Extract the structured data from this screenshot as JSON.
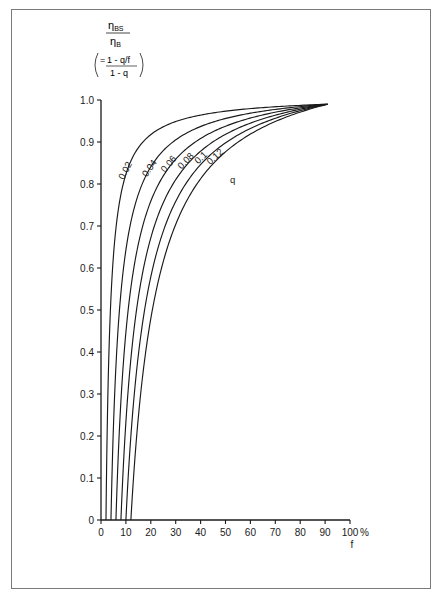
{
  "chart_data": {
    "type": "line",
    "title": "",
    "ylabel": {
      "numerator": "η_BS",
      "denominator": "η_B",
      "formula_numerator": "1 - q/f",
      "formula_denominator": "1 - q",
      "prefix": "="
    },
    "xlabel": "f",
    "x_unit": "%",
    "xlim": [
      0,
      100
    ],
    "ylim": [
      0,
      1.0
    ],
    "x_ticks": [
      0,
      10,
      20,
      30,
      40,
      50,
      60,
      70,
      80,
      90,
      100
    ],
    "x_tick_labels": [
      "0",
      "10",
      "20",
      "30",
      "40",
      "50",
      "60",
      "70",
      "80",
      "90",
      "100"
    ],
    "y_ticks": [
      0,
      0.1,
      0.2,
      0.3,
      0.4,
      0.5,
      0.6,
      0.7,
      0.8,
      0.9,
      1.0
    ],
    "y_tick_labels": [
      "0",
      "0.1",
      "0.2",
      "0.3",
      "0.4",
      "0.5",
      "0.6",
      "0.7",
      "0.8",
      "0.9",
      "1.0"
    ],
    "grid": false,
    "legend_title": "q",
    "series": [
      {
        "name": "0.02",
        "q": 0.02,
        "x": [
          2,
          5,
          10,
          20,
          30,
          50,
          70,
          91
        ],
        "values": [
          0,
          0.62,
          0.82,
          0.91,
          0.95,
          0.97,
          0.98,
          0.99
        ]
      },
      {
        "name": "0.04",
        "q": 0.04,
        "x": [
          4,
          7,
          10,
          20,
          30,
          50,
          70,
          91
        ],
        "values": [
          0,
          0.45,
          0.63,
          0.82,
          0.89,
          0.94,
          0.97,
          0.99
        ]
      },
      {
        "name": "0.06",
        "q": 0.06,
        "x": [
          6,
          10,
          15,
          20,
          30,
          50,
          70,
          91
        ],
        "values": [
          0,
          0.43,
          0.63,
          0.74,
          0.85,
          0.92,
          0.96,
          0.99
        ]
      },
      {
        "name": "0.08",
        "q": 0.08,
        "x": [
          8,
          12,
          16,
          20,
          30,
          50,
          70,
          91
        ],
        "values": [
          0,
          0.36,
          0.54,
          0.65,
          0.79,
          0.9,
          0.95,
          0.99
        ]
      },
      {
        "name": "0.1",
        "q": 0.1,
        "x": [
          10,
          14,
          18,
          22,
          30,
          50,
          70,
          91
        ],
        "values": [
          0,
          0.32,
          0.49,
          0.6,
          0.74,
          0.88,
          0.94,
          0.99
        ]
      },
      {
        "name": "0.12",
        "q": 0.12,
        "x": [
          12,
          16,
          20,
          25,
          30,
          50,
          70,
          91
        ],
        "values": [
          0,
          0.28,
          0.45,
          0.58,
          0.68,
          0.85,
          0.93,
          0.99
        ]
      }
    ]
  },
  "labels": {
    "x_unit": "%",
    "x_axis": "f",
    "legend_q": "q"
  }
}
